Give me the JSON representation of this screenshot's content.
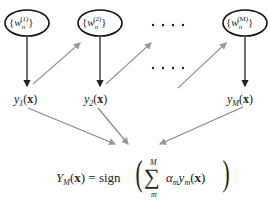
{
  "diagram": {
    "type": "boosting-ensemble",
    "nodes": [
      {
        "id": "w1",
        "label": "{w_n^(1)}",
        "base": "w",
        "sub": "n",
        "sup": "(1)"
      },
      {
        "id": "w2",
        "label": "{w_n^(2)}",
        "base": "w",
        "sub": "n",
        "sup": "(2)"
      },
      {
        "id": "wM",
        "label": "{w_n^(M)}",
        "base": "w",
        "sub": "n",
        "sup": "(M)"
      }
    ],
    "classifiers": [
      {
        "id": "y1",
        "base": "y",
        "sub": "1",
        "arg": "(x)"
      },
      {
        "id": "y2",
        "base": "y",
        "sub": "2",
        "arg": "(x)"
      },
      {
        "id": "yM",
        "base": "y",
        "sub": "M",
        "arg": "(x)"
      }
    ],
    "ellipsis": ". . . .",
    "formula": {
      "lhs_base": "Y",
      "lhs_sub": "M",
      "lhs_arg": "(x)",
      "equals": "=",
      "fn": "sign",
      "sum_upper": "M",
      "sum_lower": "m",
      "sum_symbol": "∑",
      "term_alpha": "α",
      "term_alpha_sub": "m",
      "term_y": "y",
      "term_y_sub": "m",
      "term_arg": "(x)"
    },
    "colors": {
      "dark_edge": "#222222",
      "light_edge": "#999999",
      "node_stroke": "#111111"
    }
  }
}
